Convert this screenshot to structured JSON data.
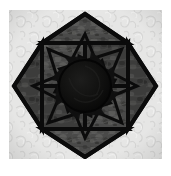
{
  "image": {
    "kind": "photograph",
    "subject": "quilt-block",
    "title": "Eight-Pointed Star Quilt Block",
    "width": 171,
    "height": 176,
    "page_background": "#ffffff"
  },
  "frame": {
    "margin_left": 9,
    "margin_top": 10,
    "margin_right": 9,
    "margin_bottom": 17,
    "inner_width": 153,
    "inner_height": 149
  },
  "background": {
    "name": "damask-fabric",
    "base_color": "#e3e3e2",
    "highlight_color": "#f1f1f0",
    "shadow_color": "#d2d2d1",
    "pattern": "floral-damask-tone-on-tone"
  },
  "star": {
    "name": "eight-pointed-star",
    "point_count": 8,
    "orthogonal_points": 4,
    "diagonal_points": 4,
    "fabric_color": "#4c4c4b",
    "fabric_highlight": "#6a6a68",
    "fabric_shadow": "#2e2e2d",
    "outline_color": "#0b0b0b",
    "outline_width": 4,
    "center_x": 85,
    "center_y": 86,
    "outer_radius_orthogonal": 72,
    "outer_radius_diagonal": 62,
    "inner_radius": 30
  },
  "pinwheel": {
    "name": "spiral-pinwheel-overlay",
    "blade_count": 8,
    "stroke_color": "#0b0b0b",
    "stroke_width": 3,
    "twist_degrees": 26,
    "radius": 48
  },
  "center_disc": {
    "name": "center-circle",
    "fill_color": "#0c0c0c",
    "rim_color": "#161616",
    "radius": 26,
    "cx": 85,
    "cy": 86
  },
  "colors": {
    "white": "#ffffff",
    "light_gray": "#e3e3e2",
    "mid_gray": "#4c4c4b",
    "near_black": "#0b0b0b"
  },
  "captions": {
    "alt_text": "Eight-pointed star quilt block in dark gray print fabric with black outlines and a dark spiral center, set on a pale gray damask background.",
    "description": "Quilt star block photograph"
  }
}
